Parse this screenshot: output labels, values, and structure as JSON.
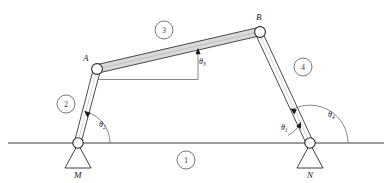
{
  "figure": {
    "type": "four-bar-linkage-diagram",
    "background_color": "#ffffff",
    "line_color": "#2b2b2b",
    "coupler_fill": "#d9d9d9"
  },
  "joints": [
    {
      "id": "M",
      "label": "M",
      "x": 78,
      "y": 143,
      "type": "fixed-pivot",
      "label_x": 78,
      "label_y": 163
    },
    {
      "id": "A",
      "label": "A",
      "x": 97,
      "y": 69,
      "type": "pin-joint",
      "label_x": 86,
      "label_y": 60
    },
    {
      "id": "B",
      "label": "B",
      "x": 260,
      "y": 32,
      "type": "pin-joint",
      "label_x": 259,
      "label_y": 19
    },
    {
      "id": "N",
      "label": "N",
      "x": 310,
      "y": 143,
      "type": "fixed-pivot",
      "label_x": 311,
      "label_y": 163
    }
  ],
  "links": [
    {
      "number": "1",
      "name": "ground-link",
      "from": "M",
      "to": "N",
      "style": "ground-line",
      "badge_x": 186,
      "badge_y": 160
    },
    {
      "number": "2",
      "name": "crank-link",
      "from": "M",
      "to": "A",
      "style": "thin-bar",
      "badge_x": 66,
      "badge_y": 104
    },
    {
      "number": "3",
      "name": "coupler-link",
      "from": "A",
      "to": "B",
      "style": "shaded-bar",
      "badge_x": 164,
      "badge_y": 30
    },
    {
      "number": "4",
      "name": "rocker-link",
      "from": "B",
      "to": "N",
      "style": "thin-bar",
      "badge_x": 303,
      "badge_y": 67
    }
  ],
  "angles": [
    {
      "id": "theta1",
      "symbol": "θ",
      "subscript": "1",
      "at_joint": "N",
      "label_x": 290,
      "label_y": 126,
      "description": "ground link angle at N"
    },
    {
      "id": "theta2",
      "symbol": "θ",
      "subscript": "2",
      "at_joint": "M",
      "label_x": 100,
      "label_y": 125,
      "description": "crank angle at M"
    },
    {
      "id": "theta3",
      "symbol": "θ",
      "subscript": "3",
      "at_joint": "coupler",
      "label_x": 198,
      "label_y": 62,
      "description": "coupler angle relative to horizontal"
    },
    {
      "id": "theta4",
      "symbol": "θ",
      "subscript": "4",
      "at_joint": "N",
      "label_x": 331,
      "label_y": 115,
      "description": "rocker angle at N"
    }
  ],
  "ground_line": {
    "x1": 8,
    "x2": 384,
    "y": 143
  }
}
